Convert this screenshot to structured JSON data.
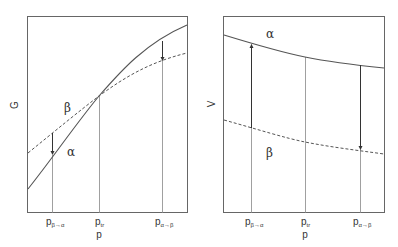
{
  "left_panel": {
    "ylabel": "G",
    "xlabel": "p",
    "ticks": [
      {
        "main": "p",
        "sub": "β→α"
      },
      {
        "main": "p",
        "sub": "tr"
      },
      {
        "main": "p",
        "sub": "α→β"
      }
    ],
    "curve_labels": {
      "beta": "β",
      "alpha": "α"
    }
  },
  "right_panel": {
    "ylabel": "V",
    "xlabel": "p",
    "ticks": [
      {
        "main": "p",
        "sub": "β→α"
      },
      {
        "main": "p",
        "sub": "tr"
      },
      {
        "main": "p",
        "sub": "α→β"
      }
    ],
    "curve_labels": {
      "alpha": "α",
      "beta": "β"
    }
  },
  "colors": {
    "line": "#555555",
    "text": "#333333",
    "background": "#ffffff"
  }
}
